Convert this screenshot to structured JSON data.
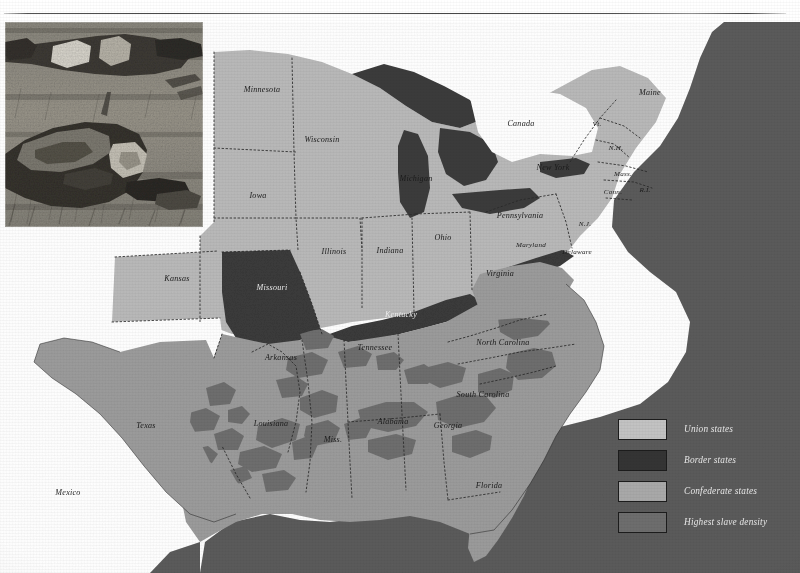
{
  "page": {
    "has_top_rule": true
  },
  "photo": {
    "name": "civil-war-battlefield-casualties-photograph",
    "description": "Black and white photograph of fallen soldiers lying in a field"
  },
  "legend": {
    "items": [
      {
        "label": "Union states",
        "color": "#c2c2c2",
        "border": "#1c1c1c"
      },
      {
        "label": "Border states",
        "color": "#343434",
        "border": "#1c1c1c"
      },
      {
        "label": "Confederate states",
        "color": "#a8a8a8",
        "border": "#1c1c1c"
      },
      {
        "label": "Highest slave density",
        "color": "#6d6d6d",
        "border": "#1c1c1c"
      }
    ]
  },
  "map": {
    "ocean_color": "#5b5b5b",
    "land_outside_color": "#ffffff",
    "union_color": "#b9b9b9",
    "border_state_color": "#3a3a3a",
    "confederate_color": "#9b9b9b",
    "slave_density_color": "#6e6e6e",
    "lake_color": "#3c3c3c",
    "labels": [
      {
        "name": "Canada",
        "text": "Canada",
        "x": 521,
        "y": 104,
        "class": "onwhite"
      },
      {
        "name": "Mexico",
        "text": "Mexico",
        "x": 68,
        "y": 473,
        "class": "onwhite"
      },
      {
        "name": "Minnesota",
        "text": "Minnesota",
        "x": 262,
        "y": 70,
        "class": ""
      },
      {
        "name": "Wisconsin",
        "text": "Wisconsin",
        "x": 322,
        "y": 120,
        "class": ""
      },
      {
        "name": "Iowa",
        "text": "Iowa",
        "x": 258,
        "y": 176,
        "class": ""
      },
      {
        "name": "Michigan",
        "text": "Michigan",
        "x": 416,
        "y": 159,
        "class": ""
      },
      {
        "name": "Illinois",
        "text": "Illinois",
        "x": 334,
        "y": 232,
        "class": ""
      },
      {
        "name": "Indiana",
        "text": "Indiana",
        "x": 390,
        "y": 231,
        "class": ""
      },
      {
        "name": "Ohio",
        "text": "Ohio",
        "x": 443,
        "y": 218,
        "class": ""
      },
      {
        "name": "Pennsylvania",
        "text": "Pennsylvania",
        "x": 520,
        "y": 196,
        "class": ""
      },
      {
        "name": "New York",
        "text": "New York",
        "x": 553,
        "y": 148,
        "class": ""
      },
      {
        "name": "Maine",
        "text": "Maine",
        "x": 650,
        "y": 73,
        "class": ""
      },
      {
        "name": "Vermont",
        "text": "Vt.",
        "x": 597,
        "y": 104,
        "class": "sm"
      },
      {
        "name": "New Hampshire",
        "text": "N.H.",
        "x": 616,
        "y": 128,
        "class": "sm"
      },
      {
        "name": "Massachusetts",
        "text": "Mass.",
        "x": 623,
        "y": 154,
        "class": "sm"
      },
      {
        "name": "Connecticut",
        "text": "Conn.",
        "x": 613,
        "y": 172,
        "class": "sm"
      },
      {
        "name": "Rhode Island",
        "text": "R.I.",
        "x": 645,
        "y": 170,
        "class": "sm"
      },
      {
        "name": "New Jersey",
        "text": "N.J.",
        "x": 585,
        "y": 204,
        "class": "sm"
      },
      {
        "name": "Delaware",
        "text": "Delaware",
        "x": 577,
        "y": 232,
        "class": "sm"
      },
      {
        "name": "Maryland",
        "text": "Maryland",
        "x": 531,
        "y": 225,
        "class": "sm"
      },
      {
        "name": "Virginia",
        "text": "Virginia",
        "x": 500,
        "y": 254,
        "class": ""
      },
      {
        "name": "Kentucky",
        "text": "Kentucky",
        "x": 401,
        "y": 295,
        "class": "lt"
      },
      {
        "name": "Missouri",
        "text": "Missouri",
        "x": 272,
        "y": 268,
        "class": "lt"
      },
      {
        "name": "Kansas",
        "text": "Kansas",
        "x": 177,
        "y": 259,
        "class": ""
      },
      {
        "name": "Texas",
        "text": "Texas",
        "x": 146,
        "y": 406,
        "class": ""
      },
      {
        "name": "Arkansas",
        "text": "Arkansas",
        "x": 281,
        "y": 338,
        "class": ""
      },
      {
        "name": "Tennessee",
        "text": "Tennessee",
        "x": 375,
        "y": 328,
        "class": ""
      },
      {
        "name": "North Carolina",
        "text": "North Carolina",
        "x": 503,
        "y": 323,
        "class": ""
      },
      {
        "name": "South Carolina",
        "text": "South Carolina",
        "x": 483,
        "y": 375,
        "class": ""
      },
      {
        "name": "Georgia",
        "text": "Georgia",
        "x": 448,
        "y": 406,
        "class": ""
      },
      {
        "name": "Alabama",
        "text": "Alabama",
        "x": 393,
        "y": 402,
        "class": ""
      },
      {
        "name": "Mississippi",
        "text": "Miss.",
        "x": 333,
        "y": 420,
        "class": ""
      },
      {
        "name": "Louisiana",
        "text": "Louisiana",
        "x": 271,
        "y": 404,
        "class": ""
      },
      {
        "name": "Florida",
        "text": "Florida",
        "x": 489,
        "y": 466,
        "class": ""
      }
    ]
  }
}
